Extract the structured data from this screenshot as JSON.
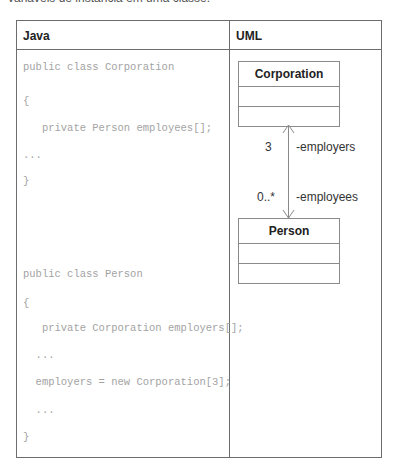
{
  "caption": "variáveis de instância em uma classe.",
  "table": {
    "headers": {
      "java": "Java",
      "uml": "UML"
    },
    "java_code": {
      "corporation": [
        "public class Corporation",
        "{",
        "   private Person employees[];",
        "...",
        "}"
      ],
      "person": [
        "public class Person",
        "{",
        "   private Corporation employers[];",
        "  ...",
        "  employers = new Corporation[3];",
        "  ...",
        "}"
      ]
    },
    "uml": {
      "classes": [
        {
          "name": "Corporation"
        },
        {
          "name": "Person"
        }
      ],
      "association": {
        "end_corporation": {
          "multiplicity": "3",
          "role": "-employers"
        },
        "end_person": {
          "multiplicity": "0..*",
          "role": "-employees"
        },
        "navigability": "bidirectional"
      }
    }
  },
  "colors": {
    "border": "#6d6d6d",
    "code_text": "#a3a3a3",
    "uml_line": "#8a8a8a"
  }
}
